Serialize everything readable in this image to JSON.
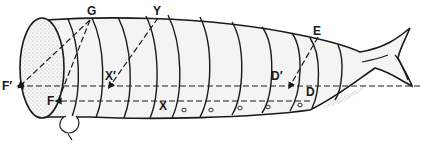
{
  "diagram": {
    "type": "larva-body-diagram",
    "colors": {
      "ink": "#1a1a1a",
      "body_fill": "#f4f4f4",
      "stipple": "#bdbdbd",
      "background": "#ffffff"
    },
    "labels": [
      {
        "id": "G",
        "text": "G",
        "x": 87,
        "y": 5
      },
      {
        "id": "Y",
        "text": "Y",
        "x": 153,
        "y": 5
      },
      {
        "id": "E",
        "text": "E",
        "x": 313,
        "y": 25
      },
      {
        "id": "F_prime",
        "text": "F′",
        "x": 2,
        "y": 80
      },
      {
        "id": "X_prime",
        "text": "X′",
        "x": 105,
        "y": 70
      },
      {
        "id": "D_prime",
        "text": "D′",
        "x": 271,
        "y": 70
      },
      {
        "id": "F",
        "text": "F",
        "x": 47,
        "y": 95
      },
      {
        "id": "X",
        "text": "X",
        "x": 159,
        "y": 100
      },
      {
        "id": "D",
        "text": "D",
        "x": 306,
        "y": 86
      }
    ]
  }
}
